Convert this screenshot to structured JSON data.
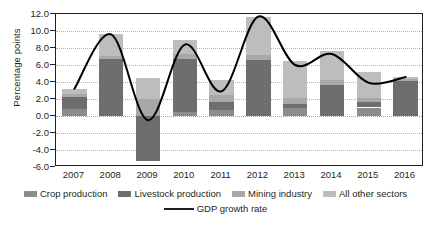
{
  "chart_data": {
    "type": "bar",
    "title": "",
    "xlabel": "",
    "ylabel": "Percentage points",
    "categories": [
      "2007",
      "2008",
      "2009",
      "2010",
      "2011",
      "2012",
      "2013",
      "2014",
      "2015",
      "2016"
    ],
    "ylim": [
      -6.0,
      12.0
    ],
    "ytick_labels": [
      "12.0",
      "10.0",
      "8.0",
      "6.0",
      "4.0",
      "2.0",
      "0.0",
      "-2.0",
      "-4.0",
      "-6.0"
    ],
    "ytick_values": [
      12.0,
      10.0,
      8.0,
      6.0,
      4.0,
      2.0,
      0.0,
      -2.0,
      -4.0,
      -6.0
    ],
    "grid": true,
    "stacked": true,
    "legend_position": "bottom",
    "series": [
      {
        "name": "Crop production",
        "color": "#8c8c8c",
        "values": [
          0.8,
          0.0,
          0.0,
          0.5,
          0.7,
          0.0,
          0.9,
          0.0,
          1.0,
          0.0
        ]
      },
      {
        "name": "Livestock production",
        "color": "#6e6e6e",
        "values": [
          1.4,
          6.7,
          -5.3,
          6.2,
          0.9,
          6.6,
          0.5,
          3.7,
          0.6,
          4.1
        ]
      },
      {
        "name": "Mining industry",
        "color": "#a8a8a8",
        "values": [
          0.4,
          0.4,
          2.0,
          0.6,
          0.9,
          0.6,
          0.7,
          0.5,
          0.5,
          0.3
        ]
      },
      {
        "name": "All other sectors",
        "color": "#bdbdbd",
        "values": [
          0.6,
          2.5,
          2.5,
          1.6,
          1.7,
          4.5,
          4.4,
          3.5,
          3.1,
          0.2
        ]
      }
    ],
    "bar_totals": [
      3.2,
      9.6,
      4.5,
      8.9,
      4.2,
      11.7,
      6.5,
      7.7,
      5.2,
      4.6
    ],
    "bar_negative_totals": [
      0.0,
      0.0,
      -5.3,
      0.0,
      0.0,
      0.0,
      0.0,
      0.0,
      0.0,
      0.0
    ],
    "line": {
      "name": "GDP growth rate",
      "color": "#000000",
      "values": [
        3.2,
        9.6,
        -0.5,
        8.4,
        2.9,
        11.7,
        6.0,
        7.3,
        3.9,
        4.6
      ]
    }
  },
  "legend": {
    "items": [
      {
        "label": "Crop production",
        "color": "#8c8c8c",
        "type": "swatch"
      },
      {
        "label": "Livestock production",
        "color": "#6e6e6e",
        "type": "swatch"
      },
      {
        "label": "Mining industry",
        "color": "#a8a8a8",
        "type": "swatch"
      },
      {
        "label": "All other sectors",
        "color": "#bdbdbd",
        "type": "swatch"
      }
    ],
    "line_item": {
      "label": "GDP growth rate",
      "color": "#000000",
      "type": "line"
    }
  }
}
